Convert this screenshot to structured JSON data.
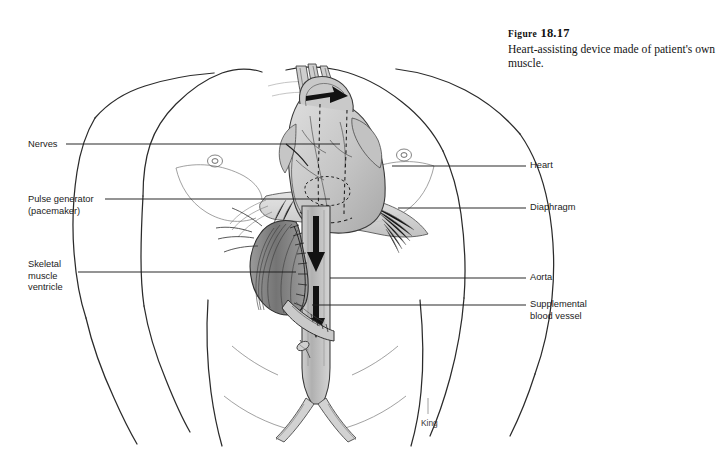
{
  "figure": {
    "label_prefix": "Figure",
    "number": "18.17",
    "caption": "Heart-assisting device made of patient's own muscle.",
    "artist_signature": "King"
  },
  "labels": {
    "left": [
      {
        "id": "nerves",
        "text": "Nerves"
      },
      {
        "id": "pulse_generator",
        "text": "Pulse generator\n(pacemaker)"
      },
      {
        "id": "skeletal_muscle_ventricle",
        "text": "Skeletal\nmuscle\nventricle"
      }
    ],
    "right": [
      {
        "id": "heart",
        "text": "Heart"
      },
      {
        "id": "diaphragm",
        "text": "Diaphragm"
      },
      {
        "id": "aorta",
        "text": "Aorta"
      },
      {
        "id": "supplemental_blood_vessel",
        "text": "Supplemental\nblood vessel"
      }
    ]
  },
  "colors": {
    "background": "#ffffff",
    "ink": "#1b1b1b",
    "line": "#2b2b2b",
    "tissue_light": "#d8d8d8",
    "tissue_mid": "#b3b3b3",
    "tissue_dark": "#8a8a8a",
    "arrow": "#111111"
  },
  "illustration": {
    "subject": "human-torso-anterior-view",
    "structures": [
      "torso-outline",
      "left-shoulder",
      "right-shoulder",
      "left-arm",
      "right-arm",
      "nipple-left",
      "nipple-right",
      "heart",
      "aortic-arch",
      "descending-aorta",
      "iliac-arteries",
      "diaphragm",
      "skeletal-muscle-ventricle",
      "supplemental-blood-vessel",
      "blood-flow-arrows"
    ]
  }
}
